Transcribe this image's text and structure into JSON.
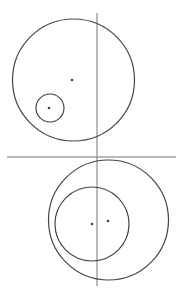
{
  "diagram": {
    "width": 180,
    "height": 293,
    "stroke_color": "#444444",
    "line_color": "#777777",
    "top_figure": {
      "big_circle": {
        "cx": 73.5,
        "cy": 80,
        "r": 61
      },
      "big_center_dot": {
        "cx": 72,
        "cy": 80
      },
      "small_circle": {
        "cx": 50,
        "cy": 108,
        "r": 14
      },
      "small_center_dot": {
        "cx": 49,
        "cy": 108
      }
    },
    "bottom_figure": {
      "big_circle": {
        "cx": 108.5,
        "cy": 220,
        "r": 60
      },
      "big_center_dot": {
        "cx": 108,
        "cy": 221
      },
      "inner_circle": {
        "cx": 92,
        "cy": 224,
        "r": 37
      },
      "inner_center_dot": {
        "cx": 92,
        "cy": 224
      }
    },
    "vertical_line": {
      "x": 97,
      "y1": 13,
      "y2": 286
    },
    "horizontal_line": {
      "y": 157,
      "x1": 7,
      "x2": 176
    }
  }
}
